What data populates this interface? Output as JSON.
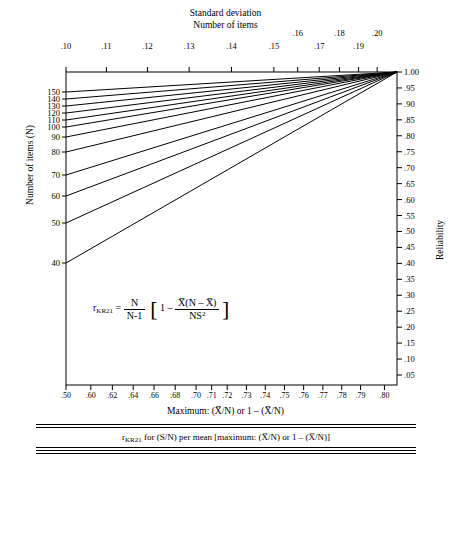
{
  "titles": {
    "standard_deviation": "Standard deviation",
    "number_of_items": "Number of items",
    "y_left": "Number of items (N)",
    "y_right": "Reliability",
    "x_bottom": "Maximum:  (X̅/N) or 1 – (X̅/N)"
  },
  "formula": {
    "r": "r",
    "r_sub": "KR21",
    "eq": "=",
    "num1": "N",
    "den1": "N-1",
    "bracket_open": "[",
    "one": "1",
    "minus": "–",
    "num2_a": "X̅(N – X̅)",
    "den2": "NS",
    "den2_sup": "2",
    "bracket_close": "]"
  },
  "chart_data": {
    "type": "line",
    "xlabel": "Maximum:  (X̅/N) or 1 – (X̅/N)",
    "ylabel": "Number of items (N)",
    "ylabel_right": "Reliability",
    "xlabel_top": "Standard deviation / Number of items",
    "grid": false,
    "legend": "none",
    "top_axis_ticks": [
      ".10",
      ".11",
      ".12",
      ".13",
      ".14",
      ".15",
      ".16",
      ".17",
      ".18",
      ".19",
      ".20"
    ],
    "top_axis_positions": [
      0.1,
      0.11,
      0.12,
      0.13,
      0.14,
      0.15,
      0.16,
      0.17,
      0.18,
      0.19,
      0.2
    ],
    "bottom_axis_ticks": [
      ".50",
      ".60",
      ".62",
      ".64",
      ".66",
      ".68",
      ".70",
      ".71",
      ".72",
      ".73",
      ".74",
      ".75",
      ".76",
      ".77",
      ".78",
      ".79",
      ".80"
    ],
    "bottom_axis_positions": [
      0.5,
      0.6,
      0.62,
      0.64,
      0.66,
      0.68,
      0.7,
      0.71,
      0.72,
      0.73,
      0.74,
      0.75,
      0.76,
      0.77,
      0.78,
      0.79,
      0.8
    ],
    "left_axis_ticks": [
      "150",
      "140",
      "130",
      "120",
      "110",
      "100",
      "90",
      "80",
      "70",
      "60",
      "50",
      "40"
    ],
    "left_axis_values": [
      150,
      140,
      130,
      120,
      110,
      100,
      90,
      80,
      70,
      60,
      50,
      40
    ],
    "right_axis_ticks": [
      "1.00",
      ".95",
      ".90",
      ".85",
      ".80",
      ".75",
      ".70",
      ".65",
      ".60",
      ".55",
      ".50",
      ".45",
      ".40",
      ".35",
      ".30",
      ".25",
      ".20",
      ".15",
      ".10",
      ".05"
    ],
    "right_axis_values": [
      1.0,
      0.95,
      0.9,
      0.85,
      0.8,
      0.75,
      0.7,
      0.65,
      0.6,
      0.55,
      0.5,
      0.45,
      0.4,
      0.35,
      0.3,
      0.25,
      0.2,
      0.15,
      0.1,
      0.05
    ],
    "ylim_left": [
      40,
      150
    ],
    "ylim_right": [
      0.05,
      1.0
    ],
    "xlim": [
      0.5,
      0.8
    ],
    "series": [
      {
        "name": "N=150",
        "left_y": 150,
        "converge": "top-right"
      },
      {
        "name": "N=140",
        "left_y": 140,
        "converge": "top-right"
      },
      {
        "name": "N=130",
        "left_y": 130,
        "converge": "top-right"
      },
      {
        "name": "N=120",
        "left_y": 120,
        "converge": "top-right"
      },
      {
        "name": "N=110",
        "left_y": 110,
        "converge": "top-right"
      },
      {
        "name": "N=100",
        "left_y": 100,
        "converge": "top-right"
      },
      {
        "name": "N=90",
        "left_y": 90,
        "converge": "top-right"
      },
      {
        "name": "N=80",
        "left_y": 80,
        "converge": "top-right"
      },
      {
        "name": "N=70",
        "left_y": 70,
        "converge": "top-right"
      },
      {
        "name": "N=60",
        "left_y": 60,
        "converge": "top-right"
      },
      {
        "name": "N=50",
        "left_y": 50,
        "converge": "top-right"
      },
      {
        "name": "N=40",
        "left_y": 40,
        "converge": "top-right"
      }
    ]
  },
  "table": {
    "title_r": "r",
    "title_sub": "KR21",
    "title_rest": "for (S/N) per mean  [maximum:   (X̅/N) or 1 – (X̅/N)]",
    "group_headers": [
      ".50",
      ".60",
      ".70",
      ".80",
      ".90"
    ],
    "sub_headers": [
      ".10",
      ".15",
      ".20"
    ],
    "rows": [
      {
        "label": "30",
        "cells": [
          [
            ".17",
            ".65",
            ".82"
          ],
          [
            ".21",
            ".67",
            ".83"
          ],
          [
            ".31",
            ".71",
            ".85"
          ],
          [
            ".48",
            ".80",
            ".90"
          ],
          [
            ".72",
            ".90",
            ".96"
          ]
        ]
      },
      {
        "label": "20",
        "cells": [
          [
            "---",
            ".47",
            ".72"
          ],
          [
            "---",
            ".49",
            ".74"
          ],
          [
            "---",
            ".56",
            ".78"
          ],
          [
            ".21",
            ".68",
            ".84"
          ],
          [
            ".58",
            ".84",
            ".93"
          ]
        ]
      },
      {
        "label": "10",
        "cells": [
          [
            "---",
            "---",
            ".42"
          ],
          [
            "---",
            "---",
            ".44"
          ],
          [
            "---",
            ".07",
            ".53"
          ],
          [
            ".22",
            ".32",
            ".67"
          ],
          [
            ".61",
            ".67",
            ".87"
          ]
        ]
      }
    ]
  }
}
